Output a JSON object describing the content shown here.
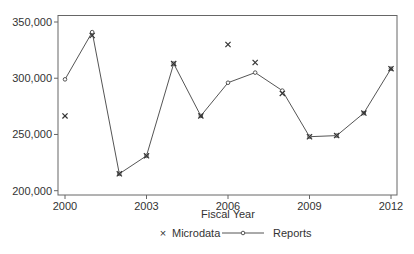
{
  "chart_data": {
    "type": "line",
    "title": "",
    "xlabel": "Fiscal Year",
    "ylabel": "",
    "x": [
      2000,
      2001,
      2002,
      2003,
      2004,
      2005,
      2006,
      2007,
      2008,
      2009,
      2010,
      2011,
      2012
    ],
    "series": [
      {
        "name": "Microdata",
        "style": "marker-only",
        "marker": "x",
        "values": [
          266500,
          338000,
          215000,
          231000,
          313000,
          266500,
          330000,
          314000,
          286500,
          248000,
          249000,
          269000,
          308500
        ]
      },
      {
        "name": "Reports",
        "style": "line-with-marker",
        "marker": "circle",
        "values": [
          299000,
          341000,
          215000,
          231000,
          313000,
          266500,
          296000,
          305000,
          289000,
          248000,
          249000,
          269000,
          308500
        ]
      }
    ],
    "xticks": [
      2000,
      2003,
      2006,
      2009,
      2012
    ],
    "xtick_labels": [
      "2000",
      "2003",
      "2006",
      "2009",
      "2012"
    ],
    "yticks": [
      200000,
      250000,
      300000,
      350000
    ],
    "ytick_labels": [
      "200,000",
      "250,000",
      "300,000",
      "350,000"
    ],
    "xlim": [
      1999.75,
      2012.2
    ],
    "ylim": [
      195800,
      355500
    ],
    "grid": false,
    "legend_position": "bottom",
    "colors": {
      "line": "#555555",
      "marker": "#333333",
      "axis": "#666666",
      "text": "#333333"
    }
  },
  "legend": {
    "items": [
      {
        "label": "Microdata",
        "symbol": "×"
      },
      {
        "label": "Reports",
        "symbol": "line-dot"
      }
    ]
  }
}
